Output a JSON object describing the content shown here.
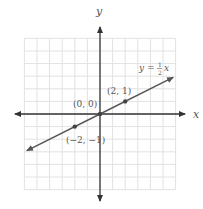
{
  "chart_data": {
    "type": "line",
    "title": "",
    "xlabel": "x",
    "ylabel": "y",
    "xlim": [
      -6,
      6
    ],
    "ylim": [
      -6,
      6
    ],
    "grid": true,
    "series": [
      {
        "name": "y = 1/2 x",
        "equation": "y = (1/2)x",
        "slope": 0.5,
        "intercept": 0,
        "x": [
          -5.8,
          5.8
        ],
        "y": [
          -2.9,
          2.9
        ]
      }
    ],
    "points": [
      {
        "x": 0,
        "y": 0,
        "label": "(0, 0)"
      },
      {
        "x": 2,
        "y": 1,
        "label": "(2, 1)"
      },
      {
        "x": -2,
        "y": -1,
        "label": "(−2, −1)"
      }
    ],
    "annotations": [
      {
        "text": "y = ½ x",
        "position": "upper right near line end"
      }
    ]
  },
  "labels": {
    "x_axis": "x",
    "y_axis": "y",
    "equation_lhs": "y =",
    "equation_num": "1",
    "equation_den": "2",
    "equation_var": "x",
    "p_origin": "(0, 0)",
    "p_pos": "(2, 1)",
    "p_neg": "(−2, −1)"
  },
  "colors": {
    "grid": "#e2e2e2",
    "axis": "#333333",
    "line": "#555555",
    "text": "#555555"
  }
}
